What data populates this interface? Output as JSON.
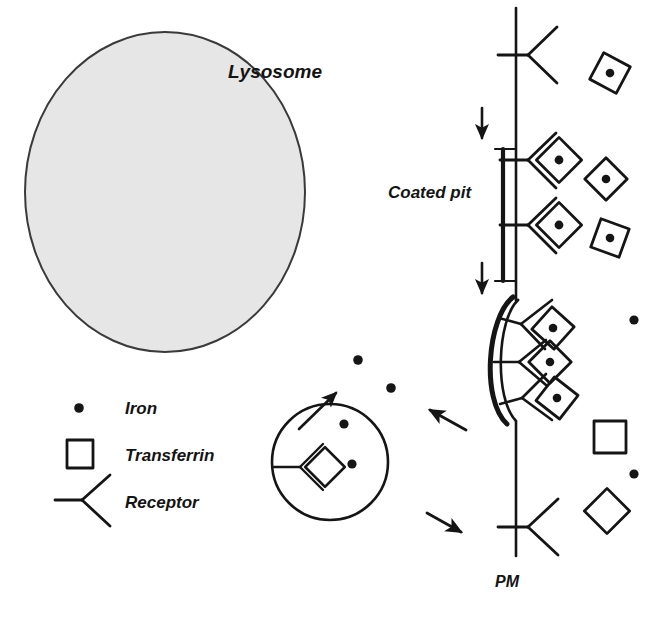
{
  "figure": {
    "type": "cell-biology-schematic",
    "width": 654,
    "height": 620,
    "background_color": "#ffffff",
    "ink_color": "#151515",
    "organelle_fill_color": "#e6e6e6",
    "organelle_stroke_color": "#3a3a3a"
  },
  "labels": {
    "lysosome": "Lysosome",
    "coated_pit": "Coated pit",
    "plasma_membrane": "PM"
  },
  "legend": {
    "items": [
      {
        "key": "iron",
        "label": "Iron",
        "glyph": "filled-dot"
      },
      {
        "key": "transferrin",
        "label": "Transferrin",
        "glyph": "open-square"
      },
      {
        "key": "receptor",
        "label": "Receptor",
        "glyph": "y-fork"
      }
    ]
  },
  "structures": {
    "lysosome": {
      "name": "Lysosome",
      "shape": "ellipse",
      "cx": 165,
      "cy": 192,
      "rx": 140,
      "ry": 160,
      "filled": true
    },
    "endosome": {
      "name": "Endosome",
      "shape": "circle",
      "cx": 330,
      "cy": 462,
      "r": 58,
      "filled": false,
      "contains": {
        "receptor_transferrin_complexes": 1,
        "free_iron_dots": 2,
        "transferrin_is_empty": true
      }
    },
    "plasma_membrane": {
      "name": "Plasma membrane",
      "shape": "vertical-line",
      "x": 516,
      "y_top": 8,
      "y_bottom": 556
    },
    "coated_pit": {
      "name": "Coated pit",
      "shape": "invagination",
      "bound_complexes": 3,
      "coat_line": "thick-outer-arc"
    }
  },
  "membrane_receptors": [
    {
      "id": "receptor-top",
      "y": 55,
      "occupied": false,
      "cargo": null
    },
    {
      "id": "receptor-upper-pit",
      "y": 160,
      "occupied": true,
      "cargo": "transferrin-with-iron"
    },
    {
      "id": "receptor-lower-pit",
      "y": 225,
      "occupied": true,
      "cargo": "transferrin-with-iron"
    },
    {
      "id": "receptor-bottom",
      "y": 527,
      "occupied": false,
      "cargo": null
    }
  ],
  "coated_pit_complexes": [
    {
      "id": "pit-complex-1",
      "y": 328,
      "cargo": "transferrin-with-iron"
    },
    {
      "id": "pit-complex-2",
      "y": 362,
      "cargo": "transferrin-with-iron"
    },
    {
      "id": "pit-complex-3",
      "y": 397,
      "cargo": "transferrin-with-iron"
    }
  ],
  "extracellular_particles": [
    {
      "id": "holo-transferrin-1",
      "type": "transferrin-with-iron",
      "x": 610,
      "y": 73,
      "rotation": 28
    },
    {
      "id": "holo-transferrin-2",
      "type": "transferrin-with-iron",
      "x": 606,
      "y": 179,
      "rotation": 45
    },
    {
      "id": "holo-transferrin-3",
      "type": "transferrin-with-iron",
      "x": 610,
      "y": 238,
      "rotation": 20
    },
    {
      "id": "free-iron-right-1",
      "type": "iron",
      "x": 634,
      "y": 320
    },
    {
      "id": "apo-transferrin-square",
      "type": "transferrin-empty",
      "x": 610,
      "y": 437,
      "rotation": 0
    },
    {
      "id": "free-iron-right-2",
      "type": "iron",
      "x": 634,
      "y": 474
    },
    {
      "id": "apo-transferrin-diamond",
      "type": "transferrin-empty",
      "x": 607,
      "y": 511,
      "rotation": 45
    }
  ],
  "cytoplasmic_iron": [
    {
      "id": "iron-escape-1",
      "x": 358,
      "y": 360
    },
    {
      "id": "iron-escape-2",
      "x": 391,
      "y": 388
    },
    {
      "id": "iron-in-endosome-1",
      "x": 344,
      "y": 424
    },
    {
      "id": "iron-in-endosome-2",
      "x": 352,
      "y": 464
    }
  ],
  "arrows": [
    {
      "id": "arrow-invagination-1",
      "direction": "down",
      "x1": 482,
      "y1": 108,
      "x2": 482,
      "y2": 140
    },
    {
      "id": "arrow-invagination-2",
      "direction": "down",
      "x1": 482,
      "y1": 263,
      "x2": 482,
      "y2": 295
    },
    {
      "id": "arrow-internalization",
      "direction": "up-left",
      "x1": 466,
      "y1": 430,
      "x2": 428,
      "y2": 409
    },
    {
      "id": "arrow-recycling",
      "direction": "down-right",
      "x1": 427,
      "y1": 513,
      "x2": 463,
      "y2": 533
    },
    {
      "id": "arrow-iron-release",
      "direction": "up-right",
      "x1": 299,
      "y1": 429,
      "x2": 338,
      "y2": 391
    }
  ]
}
